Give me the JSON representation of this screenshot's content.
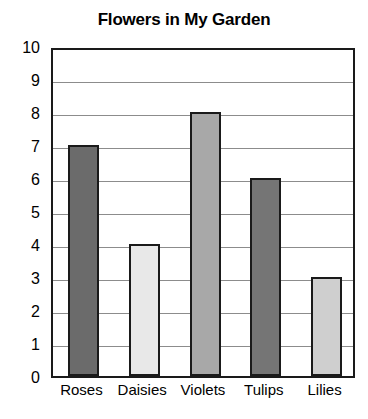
{
  "chart_data": {
    "type": "bar",
    "title": "Flowers in My Garden",
    "xlabel": "",
    "ylabel": "",
    "categories": [
      "Roses",
      "Daisies",
      "Violets",
      "Tulips",
      "Lilies"
    ],
    "values": [
      7,
      4,
      8,
      6,
      3
    ],
    "ylim": [
      0,
      10
    ],
    "ytick_labels": [
      "0",
      "1",
      "2",
      "3",
      "4",
      "5",
      "6",
      "7",
      "8",
      "9",
      "10"
    ],
    "ytick_values": [
      0,
      1,
      2,
      3,
      4,
      5,
      6,
      7,
      8,
      9,
      10
    ],
    "grid": "horizontal",
    "legend": "none",
    "bar_colors": [
      "#6b6b6b",
      "#e8e8e8",
      "#a8a8a8",
      "#757575",
      "#cfcfcf"
    ],
    "bar_border_color": "#1a1a1a",
    "axis_color": "#1a1a1a",
    "gridline_color": "#8c8c8c",
    "background_color": "#ffffff",
    "text_color": "#000000"
  }
}
